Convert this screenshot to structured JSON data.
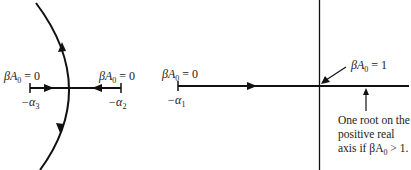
{
  "diagram": {
    "type": "root-locus",
    "left_panel": {
      "pole_alpha3": {
        "label_top": "βA",
        "label_top_sub": "0",
        "label_top_rest": " = 0",
        "label_bottom": "−α",
        "label_bottom_sub": "3"
      },
      "pole_alpha2": {
        "label_top": "βA",
        "label_top_sub": "0",
        "label_top_rest": " = 0",
        "label_bottom": "−α",
        "label_bottom_sub": "2"
      }
    },
    "right_panel": {
      "pole_alpha1": {
        "label_top": "βA",
        "label_top_sub": "0",
        "label_top_rest": " = 0",
        "label_bottom": "−α",
        "label_bottom_sub": "1"
      },
      "origin_annotation": {
        "text": "βA",
        "sub": "0",
        "rest": " = 1"
      },
      "note": {
        "line1": "One root on the",
        "line2": "positive real",
        "line3_prefix": "axis if βA",
        "line3_sub": "0",
        "line3_rest": " > 1."
      }
    },
    "colors": {
      "stroke": "#111111",
      "background": "#ffffff"
    }
  }
}
